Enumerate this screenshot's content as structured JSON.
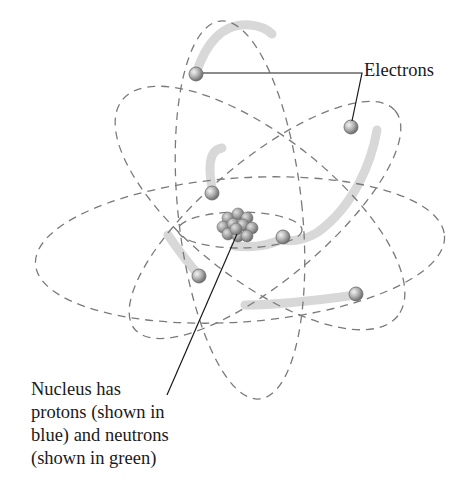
{
  "figure": {
    "labels": {
      "electrons": "Electrons",
      "nucleus_lines": [
        "Nucleus has",
        "protons (shown in",
        "blue) and neutrons",
        "(shown in green)"
      ]
    },
    "parts": {
      "nucleus": {
        "description": "cluster of protons and neutrons",
        "color": "#8f8f8f"
      },
      "electrons": {
        "count": 7,
        "color": "#a9a9a9"
      },
      "orbits": {
        "count": 4,
        "style": "dashed",
        "color": "#7a7a7a"
      },
      "trails": {
        "color": "#d6d6d6"
      }
    }
  }
}
